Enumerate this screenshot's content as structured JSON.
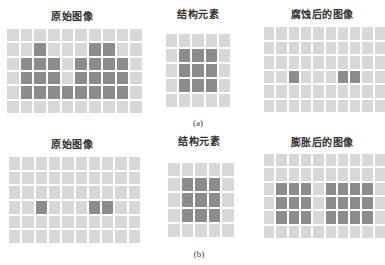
{
  "colors": {
    "cell_off": "#d8d8d8",
    "cell_on": "#8c8c8c",
    "gap": "#ffffff"
  },
  "panels": {
    "a": {
      "caption": "(a)",
      "original": {
        "title": "原始图像",
        "rows": 6,
        "cols": 10,
        "matrix": [
          [
            0,
            0,
            0,
            0,
            0,
            0,
            0,
            0,
            0,
            0
          ],
          [
            0,
            0,
            1,
            0,
            0,
            0,
            1,
            1,
            0,
            0
          ],
          [
            0,
            1,
            1,
            1,
            0,
            1,
            1,
            1,
            1,
            0
          ],
          [
            0,
            1,
            1,
            1,
            0,
            1,
            1,
            1,
            1,
            0
          ],
          [
            0,
            1,
            1,
            1,
            1,
            1,
            1,
            1,
            1,
            0
          ],
          [
            0,
            0,
            0,
            0,
            0,
            0,
            0,
            0,
            0,
            0
          ]
        ]
      },
      "structuring_element": {
        "title": "结构元素",
        "rows": 5,
        "cols": 5,
        "matrix": [
          [
            0,
            0,
            0,
            0,
            0
          ],
          [
            0,
            1,
            1,
            1,
            0
          ],
          [
            0,
            1,
            1,
            1,
            0
          ],
          [
            0,
            1,
            1,
            1,
            0
          ],
          [
            0,
            0,
            0,
            0,
            0
          ]
        ]
      },
      "result": {
        "title": "腐蚀后的图像",
        "rows": 6,
        "cols": 10,
        "matrix": [
          [
            0,
            0,
            0,
            0,
            0,
            0,
            0,
            0,
            0,
            0
          ],
          [
            0,
            0,
            0,
            0,
            0,
            0,
            0,
            0,
            0,
            0
          ],
          [
            0,
            0,
            0,
            0,
            0,
            0,
            0,
            0,
            0,
            0
          ],
          [
            0,
            0,
            1,
            0,
            0,
            0,
            1,
            1,
            0,
            0
          ],
          [
            0,
            0,
            0,
            0,
            0,
            0,
            0,
            0,
            0,
            0
          ],
          [
            0,
            0,
            0,
            0,
            0,
            0,
            0,
            0,
            0,
            0
          ]
        ]
      }
    },
    "b": {
      "caption": "(b)",
      "original": {
        "title": "原始图像",
        "rows": 6,
        "cols": 10,
        "matrix": [
          [
            0,
            0,
            0,
            0,
            0,
            0,
            0,
            0,
            0,
            0
          ],
          [
            0,
            0,
            0,
            0,
            0,
            0,
            0,
            0,
            0,
            0
          ],
          [
            0,
            0,
            0,
            0,
            0,
            0,
            0,
            0,
            0,
            0
          ],
          [
            0,
            0,
            1,
            0,
            0,
            0,
            1,
            1,
            0,
            0
          ],
          [
            0,
            0,
            0,
            0,
            0,
            0,
            0,
            0,
            0,
            0
          ],
          [
            0,
            0,
            0,
            0,
            0,
            0,
            0,
            0,
            0,
            0
          ]
        ]
      },
      "structuring_element": {
        "title": "结构元素",
        "rows": 5,
        "cols": 5,
        "matrix": [
          [
            0,
            0,
            0,
            0,
            0
          ],
          [
            0,
            1,
            1,
            1,
            0
          ],
          [
            0,
            1,
            1,
            1,
            0
          ],
          [
            0,
            1,
            1,
            1,
            0
          ],
          [
            0,
            0,
            0,
            0,
            0
          ]
        ]
      },
      "result": {
        "title": "膨胀后的图像",
        "rows": 6,
        "cols": 10,
        "matrix": [
          [
            0,
            0,
            0,
            0,
            0,
            0,
            0,
            0,
            0,
            0
          ],
          [
            0,
            0,
            0,
            0,
            0,
            0,
            0,
            0,
            0,
            0
          ],
          [
            0,
            1,
            1,
            1,
            0,
            1,
            1,
            1,
            1,
            0
          ],
          [
            0,
            1,
            1,
            1,
            0,
            1,
            1,
            1,
            1,
            0
          ],
          [
            0,
            1,
            1,
            1,
            0,
            1,
            1,
            1,
            1,
            0
          ],
          [
            0,
            0,
            0,
            0,
            0,
            0,
            0,
            0,
            0,
            0
          ]
        ]
      }
    }
  }
}
